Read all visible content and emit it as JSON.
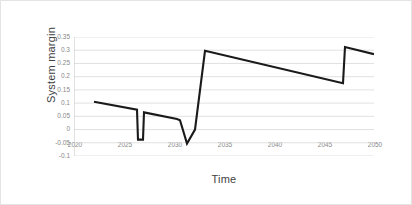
{
  "chart_data": {
    "type": "line",
    "title": "",
    "xlabel": "Time",
    "ylabel": "System margin",
    "xlim": [
      2020,
      2050
    ],
    "ylim": [
      -0.1,
      0.35
    ],
    "grid": true,
    "legend": false,
    "legend_position": "none",
    "line_color": "#1a1a1a",
    "gridline_color": "#d9d9d9",
    "axis_color": "#bfbfbf",
    "tick_label_color": "#888888",
    "xticks": [
      "2020",
      "2025",
      "2030",
      "2035",
      "2040",
      "2045",
      "2050"
    ],
    "xtick_values": [
      2020,
      2025,
      2030,
      2035,
      2040,
      2045,
      2050
    ],
    "yticks": [
      "0.35",
      "0.3",
      "0.25",
      "0.2",
      "0.15",
      "0.1",
      "0.05",
      "0",
      "-0.05",
      "-0.1"
    ],
    "ytick_values": [
      0.35,
      0.3,
      0.25,
      0.2,
      0.15,
      0.1,
      0.05,
      0,
      -0.05,
      -0.1
    ],
    "series": [
      {
        "name": "System margin",
        "x": [
          2022.0,
          2026.3,
          2026.4,
          2026.9,
          2027.0,
          2030.3,
          2030.6,
          2031.3,
          2032.1,
          2033.1,
          2046.9,
          2047.1,
          2050.0
        ],
        "y": [
          0.105,
          0.075,
          -0.038,
          -0.038,
          0.065,
          0.04,
          0.035,
          -0.053,
          0.0,
          0.298,
          0.175,
          0.312,
          0.285
        ]
      }
    ],
    "annotations": []
  }
}
